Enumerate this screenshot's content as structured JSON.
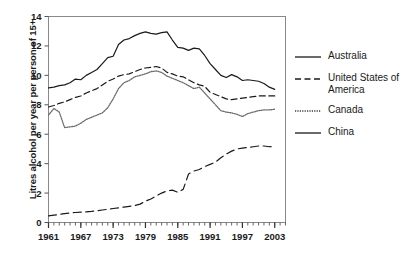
{
  "chart_data": {
    "type": "line",
    "title": "",
    "xlabel": "",
    "ylabel": "Litres alcohol per year per person of 15+",
    "xlim": [
      1961,
      2005
    ],
    "ylim": [
      0,
      14
    ],
    "ytick_values": [
      0,
      2,
      4,
      6,
      8,
      10,
      12,
      14
    ],
    "ytick_labels": [
      "0",
      "2",
      "4",
      "6",
      "8",
      "10",
      "12",
      "14"
    ],
    "xtick_values": [
      1961,
      1967,
      1973,
      1979,
      1985,
      1991,
      1997,
      2003
    ],
    "xtick_labels": [
      "1961",
      "1967",
      "1973",
      "1979",
      "1985",
      "1991",
      "1997",
      "2003"
    ],
    "minor_xticks": true,
    "grid": false,
    "legend_position": "right",
    "x": [
      1961,
      1962,
      1963,
      1964,
      1965,
      1966,
      1967,
      1968,
      1969,
      1970,
      1971,
      1972,
      1973,
      1974,
      1975,
      1976,
      1977,
      1978,
      1979,
      1980,
      1981,
      1982,
      1983,
      1984,
      1985,
      1986,
      1987,
      1988,
      1989,
      1990,
      1991,
      1992,
      1993,
      1994,
      1995,
      1996,
      1997,
      1998,
      1999,
      2000,
      2001,
      2002,
      2003
    ],
    "series": [
      {
        "name": "Australia",
        "style": "solid",
        "color": "#1a1a1a",
        "values": [
          9.15,
          9.2,
          9.3,
          9.35,
          9.5,
          9.75,
          9.7,
          10.0,
          10.2,
          10.4,
          10.8,
          11.2,
          11.3,
          12.1,
          12.4,
          12.5,
          12.7,
          12.85,
          12.95,
          12.85,
          12.8,
          12.9,
          12.95,
          12.4,
          11.9,
          11.85,
          11.7,
          11.85,
          11.8,
          11.35,
          10.8,
          10.4,
          10.0,
          9.85,
          10.05,
          9.9,
          9.65,
          9.7,
          9.65,
          9.6,
          9.45,
          9.2,
          9.05
        ]
      },
      {
        "name": "United States of\nAmerica",
        "style": "dashed",
        "color": "#1a1a1a",
        "values": [
          7.85,
          7.95,
          8.1,
          8.2,
          8.35,
          8.5,
          8.6,
          8.8,
          8.95,
          9.1,
          9.35,
          9.6,
          9.75,
          9.95,
          10.05,
          10.1,
          10.25,
          10.4,
          10.5,
          10.55,
          10.6,
          10.5,
          10.2,
          10.1,
          9.95,
          9.9,
          9.7,
          9.5,
          9.35,
          9.25,
          8.85,
          8.7,
          8.55,
          8.4,
          8.35,
          8.4,
          8.45,
          8.5,
          8.55,
          8.6,
          8.6,
          8.6,
          8.6
        ]
      },
      {
        "name": "Canada",
        "style": "dotted",
        "color": "#6b6b6b",
        "values": [
          7.3,
          7.75,
          7.5,
          6.45,
          6.5,
          6.55,
          6.75,
          7.0,
          7.15,
          7.3,
          7.45,
          7.8,
          8.4,
          9.1,
          9.5,
          9.65,
          9.9,
          10.0,
          10.1,
          10.25,
          10.3,
          10.2,
          9.95,
          9.8,
          9.65,
          9.5,
          9.3,
          9.1,
          9.2,
          8.8,
          8.4,
          8.0,
          7.6,
          7.5,
          7.45,
          7.35,
          7.2,
          7.4,
          7.5,
          7.6,
          7.65,
          7.65,
          7.7
        ]
      },
      {
        "name": "China",
        "style": "longdash",
        "color": "#1a1a1a",
        "values": [
          0.45,
          0.5,
          0.55,
          0.6,
          0.65,
          0.68,
          0.7,
          0.72,
          0.75,
          0.8,
          0.85,
          0.9,
          0.95,
          1.0,
          1.05,
          1.1,
          1.15,
          1.25,
          1.45,
          1.6,
          1.8,
          2.0,
          2.15,
          2.2,
          2.05,
          2.25,
          3.3,
          3.5,
          3.6,
          3.8,
          3.95,
          4.1,
          4.4,
          4.65,
          4.85,
          5.0,
          5.05,
          5.1,
          5.15,
          5.2,
          5.2,
          5.15,
          5.15
        ]
      }
    ],
    "legend_entries": [
      {
        "label": "Australia",
        "style": "solid"
      },
      {
        "label": "United States of\nAmerica",
        "style": "dashed"
      },
      {
        "label": "Canada",
        "style": "dotted"
      },
      {
        "label": "China",
        "style": "solid"
      }
    ]
  }
}
